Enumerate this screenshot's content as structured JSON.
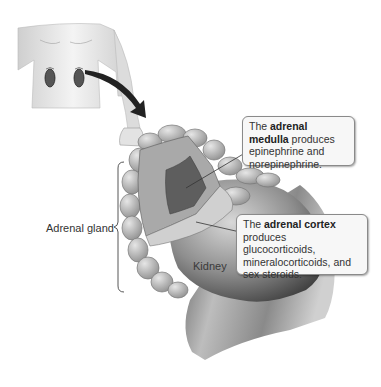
{
  "labels": {
    "adrenal_gland": "Adrenal gland",
    "kidney": "Kidney"
  },
  "callouts": {
    "medulla": {
      "prefix": "The ",
      "term": "adrenal medulla",
      "text": "produces epinephrine and norepinephrine."
    },
    "cortex": {
      "prefix": "The ",
      "term": "adrenal cortex",
      "text": "produces glucocorticoids, mineralocorticoids, and sex steroids."
    }
  },
  "colors": {
    "background": "#ffffff",
    "callout_fill": "#f7f7f7",
    "callout_border": "#8a8a8a",
    "text": "#333333"
  }
}
